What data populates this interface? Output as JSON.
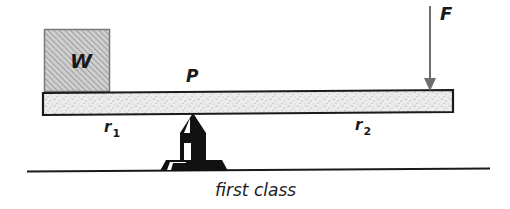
{
  "diagram": {
    "title": "first class",
    "type": "lever",
    "labels": {
      "weight": "W",
      "fulcrum": "P",
      "force": "F",
      "r1_base": "r",
      "r1_sub": "1",
      "r2_base": "r",
      "r2_sub": "2",
      "caption": "first class"
    },
    "colors": {
      "ink": "#1a1a1a",
      "beam_fill": "#e6e6e6",
      "weight_fill": "#bdbdbd",
      "arrow": "#6e6e6e",
      "background": "#ffffff"
    }
  }
}
